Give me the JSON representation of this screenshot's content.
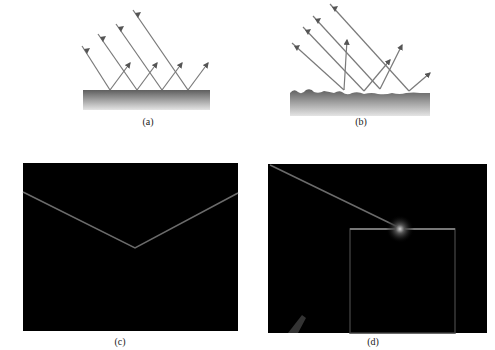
{
  "panels": {
    "a": {
      "label": "(a)",
      "description": "Specular reflection from a smooth surface"
    },
    "b": {
      "label": "(b)",
      "description": "Diffuse reflection from a rough surface"
    },
    "c": {
      "label": "(c)",
      "description": "Photograph of light beam reflecting from a smooth surface"
    },
    "d": {
      "label": "(d)",
      "description": "Photograph of light beam striking a rough surface"
    }
  },
  "colors": {
    "ray": "#7a7a7a",
    "arrowhead": "#555555",
    "surface_top": "#6a6a6a",
    "surface_bottom": "#e0e0e0",
    "photo_bg": "#000000",
    "beam": "#6b6b6b"
  }
}
